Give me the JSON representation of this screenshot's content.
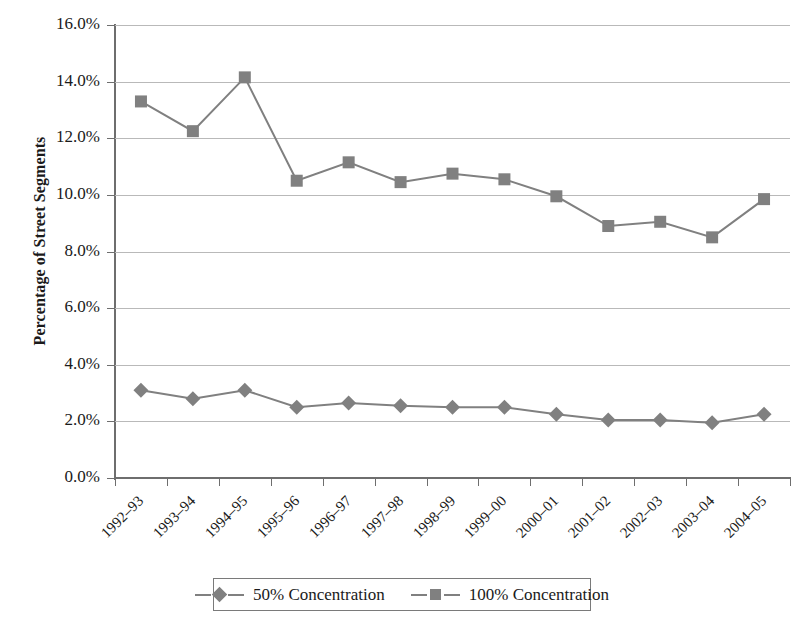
{
  "chart_data": {
    "type": "line",
    "title": "",
    "xlabel": "",
    "ylabel": "Percentage of Street Segments",
    "ylim": [
      0,
      16
    ],
    "ytick_labels": [
      "0.0%",
      "2.0%",
      "4.0%",
      "6.0%",
      "8.0%",
      "10.0%",
      "12.0%",
      "14.0%",
      "16.0%"
    ],
    "ytick_values": [
      0,
      2,
      4,
      6,
      8,
      10,
      12,
      14,
      16
    ],
    "grid": true,
    "legend_position": "bottom",
    "categories": [
      "1992–93",
      "1993–94",
      "1994–95",
      "1995–96",
      "1996–97",
      "1997–98",
      "1998–99",
      "1999–00",
      "2000–01",
      "2001–02",
      "2002–03",
      "2003–04",
      "2004–05"
    ],
    "series": [
      {
        "name": "50% Concentration",
        "marker": "diamond",
        "color": "#808080",
        "values": [
          3.1,
          2.8,
          3.1,
          2.5,
          2.65,
          2.55,
          2.5,
          2.5,
          2.25,
          2.05,
          2.05,
          1.95,
          2.25
        ]
      },
      {
        "name": "100% Concentration",
        "marker": "square",
        "color": "#808080",
        "values": [
          13.3,
          12.25,
          14.15,
          10.5,
          11.15,
          10.45,
          10.75,
          10.55,
          9.95,
          8.9,
          9.05,
          8.5,
          9.85
        ]
      }
    ]
  },
  "legend": {
    "entries": [
      {
        "label": "50% Concentration"
      },
      {
        "label": "100% Concentration"
      }
    ]
  }
}
